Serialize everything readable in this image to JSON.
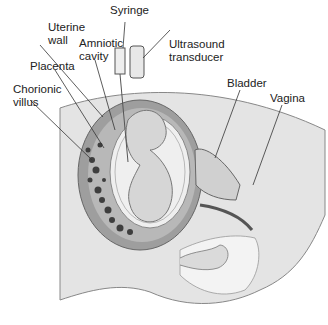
{
  "labels": {
    "syringe": "Syringe",
    "uterine_wall_1": "Uterine",
    "uterine_wall_2": "wall",
    "amniotic_1": "Amniotic",
    "amniotic_2": "cavity",
    "ultrasound_1": "Ultrasound",
    "ultrasound_2": "transducer",
    "placenta": "Placenta",
    "chorionic_1": "Chorionic",
    "chorionic_2": "villus",
    "bladder": "Bladder",
    "vagina": "Vagina"
  },
  "colors": {
    "body": "#e6e6e6",
    "body_dark": "#cfcfcf",
    "uterus_wall": "#9a9a9a",
    "placenta": "#b5b5b5",
    "amnion": "#f2f2f2",
    "villi": "#444444",
    "line": "#333333"
  }
}
